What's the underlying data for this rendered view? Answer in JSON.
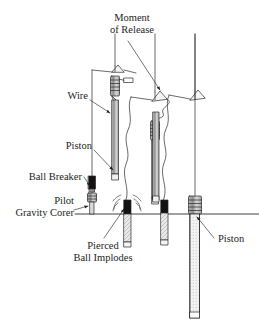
{
  "figure": {
    "type": "technical-line-diagram",
    "background_color": "#ffffff",
    "line_color": "#2a2a2a",
    "fill_dark": "#111111",
    "fill_light": "#cccccc",
    "stage_count": 4
  },
  "labels": {
    "moment_of_release_line1": "Moment",
    "moment_of_release_line2": "of Release",
    "wire": "Wire",
    "piston_left": "Piston",
    "ball_breaker": "Ball Breaker",
    "pilot_line1": "Pilot",
    "pilot_line2": "Gravity Corer",
    "pierced_line1": "Pierced",
    "pierced_line2": "Ball Implodes",
    "piston_right": "Piston"
  },
  "stages": [
    {
      "name": "stage-1-suspended",
      "description": "Corer suspended on wire, trigger arm cocked, pilot gravity corer hanging below ball breaker",
      "wire_x": 115,
      "has_trigger_arm": true,
      "has_weight_head": true,
      "has_pilot_corer": true,
      "wire_slack": false
    },
    {
      "name": "stage-2-release",
      "description": "Moment of release: trigger arm trips, wire goes slack in an S curve",
      "wire_x": 155,
      "has_trigger_arm": true,
      "has_weight_head": true,
      "has_pilot_corer": false,
      "wire_slack": true
    },
    {
      "name": "stage-3-free-fall",
      "description": "Corer in free fall, wire trailing wavy and slack, trigger arm empty",
      "wire_x": 195,
      "has_trigger_arm": true,
      "has_weight_head": false,
      "has_pilot_corer": false,
      "wire_slack": true
    },
    {
      "name": "stage-4-penetration",
      "description": "Core barrel penetrates seafloor, piston held at sediment surface",
      "wire_x": 195,
      "has_trigger_arm": false,
      "has_weight_head": true,
      "has_pilot_corer": false,
      "wire_slack": false
    }
  ],
  "seafloor": {
    "name": "sediment-surface-line",
    "y": 214,
    "x_start": 75,
    "x_end": 259
  },
  "annotations": {
    "implosion_marker": "radiating shock arcs at pierced ball",
    "leader_style": "thin straight leader lines with solid arrowheads"
  }
}
